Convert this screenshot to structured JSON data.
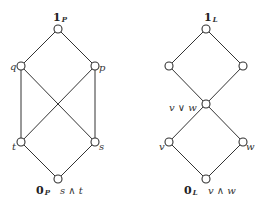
{
  "diagrams": [
    {
      "name": "P",
      "nodes": [
        {
          "id": "1P",
          "x": 58,
          "y": 29,
          "label_main": "1",
          "label_sub": "P",
          "label_x": 53,
          "label_y": 21
        },
        {
          "id": "q",
          "x": 21,
          "y": 66,
          "label": "q",
          "label_x": 10,
          "label_y": 70
        },
        {
          "id": "p",
          "x": 95,
          "y": 66,
          "label": "p",
          "label_x": 99,
          "label_y": 71
        },
        {
          "id": "t",
          "x": 21,
          "y": 142,
          "label": "t",
          "label_x": 12,
          "label_y": 150
        },
        {
          "id": "s",
          "x": 95,
          "y": 142,
          "label": "s",
          "label_x": 99,
          "label_y": 150
        },
        {
          "id": "0P",
          "x": 58,
          "y": 179,
          "label_main": "0",
          "label_sub": "P",
          "label_x": 36,
          "label_y": 194,
          "label_extra": "s ∧ t",
          "label_extra_x": 60
        }
      ],
      "edges": [
        [
          "1P",
          "q"
        ],
        [
          "1P",
          "p"
        ],
        [
          "q",
          "t"
        ],
        [
          "q",
          "s"
        ],
        [
          "p",
          "t"
        ],
        [
          "p",
          "s"
        ],
        [
          "t",
          "0P"
        ],
        [
          "s",
          "0P"
        ]
      ]
    },
    {
      "name": "L",
      "nodes": [
        {
          "id": "1L",
          "x": 206,
          "y": 29,
          "label_main": "1",
          "label_sub": "L",
          "label_x": 204,
          "label_y": 21
        },
        {
          "id": "a",
          "x": 169,
          "y": 66
        },
        {
          "id": "b",
          "x": 243,
          "y": 66
        },
        {
          "id": "vjw",
          "x": 206,
          "y": 104,
          "label": "v ∨ w",
          "label_x": 169,
          "label_y": 111
        },
        {
          "id": "v",
          "x": 169,
          "y": 142,
          "label": "v",
          "label_x": 159,
          "label_y": 150
        },
        {
          "id": "w",
          "x": 243,
          "y": 142,
          "label": "w",
          "label_x": 246,
          "label_y": 150
        },
        {
          "id": "0L",
          "x": 206,
          "y": 179,
          "label_main": "0",
          "label_sub": "L",
          "label_x": 184,
          "label_y": 194,
          "label_extra": "v ∧ w",
          "label_extra_x": 208
        }
      ],
      "edges": [
        [
          "1L",
          "a"
        ],
        [
          "1L",
          "b"
        ],
        [
          "a",
          "vjw"
        ],
        [
          "b",
          "vjw"
        ],
        [
          "vjw",
          "v"
        ],
        [
          "vjw",
          "w"
        ],
        [
          "v",
          "0L"
        ],
        [
          "w",
          "0L"
        ]
      ]
    }
  ],
  "style": {
    "stroke": "#333333",
    "node_fill": "#ffffff",
    "node_radius": 4
  }
}
